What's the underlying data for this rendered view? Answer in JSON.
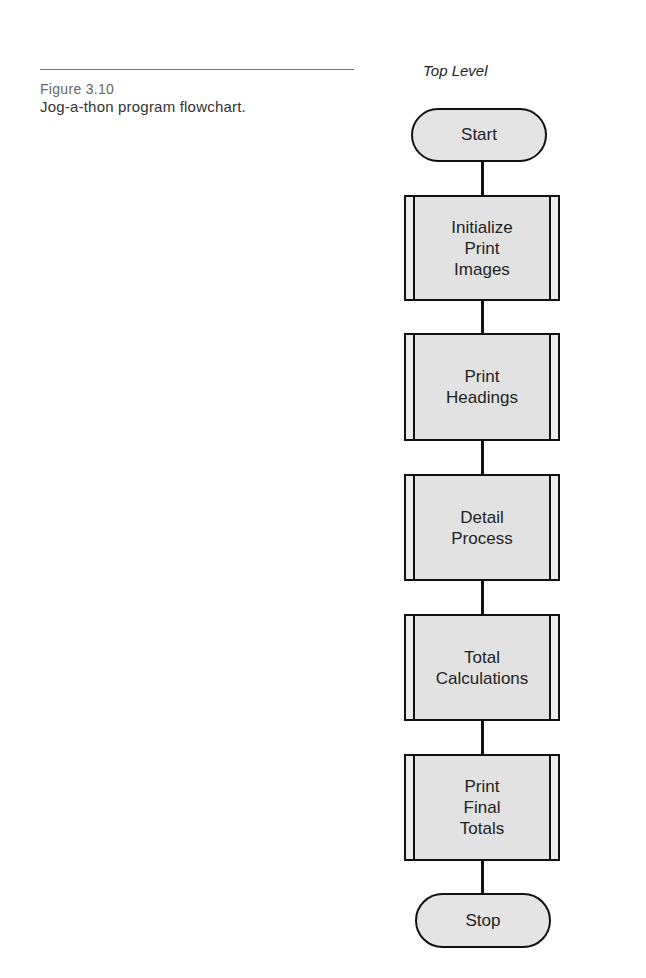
{
  "figure": {
    "label": "Figure 3.10",
    "caption": "Jog-a-thon program flowchart."
  },
  "flowchart": {
    "title": "Top Level",
    "start": "Start",
    "steps": [
      "Initialize\nPrint\nImages",
      "Print\nHeadings",
      "Detail\nProcess",
      "Total\nCalculations",
      "Print\nFinal\nTotals"
    ],
    "stop": "Stop"
  }
}
